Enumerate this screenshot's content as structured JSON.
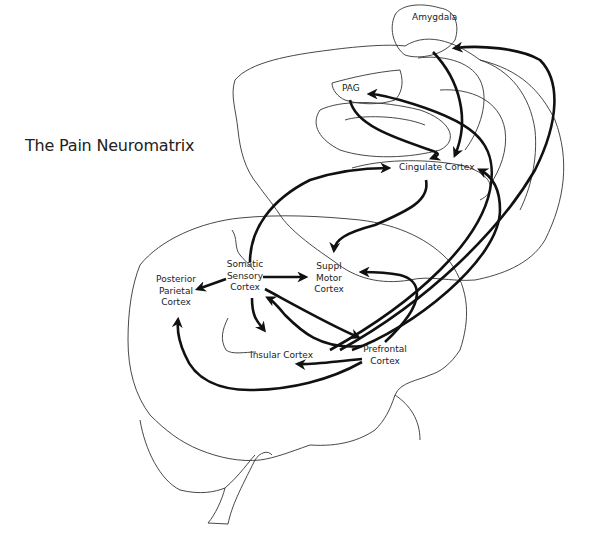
{
  "title": "The Pain Neuromatrix",
  "regions": {
    "amygdala": "Amygdala",
    "pag": "PAG",
    "cingulate": "Cingulate Cortex",
    "somatic_1": "Somatic",
    "somatic_2": "Sensory",
    "somatic_3": "Cortex",
    "suppl_1": "Suppl",
    "suppl_2": "Motor",
    "suppl_3": "Cortex",
    "posterior_1": "Posterior",
    "posterior_2": "Parietal",
    "posterior_3": "Cortex",
    "insular": "Insular Cortex",
    "prefrontal_1": "Prefrontal",
    "prefrontal_2": "Cortex"
  },
  "connections": [
    {
      "from": "Amygdala",
      "to": "Cingulate Cortex"
    },
    {
      "from": "Prefrontal Cortex",
      "to": "Amygdala"
    },
    {
      "from": "Prefrontal Cortex",
      "to": "PAG"
    },
    {
      "from": "PAG",
      "to": "Cingulate Cortex"
    },
    {
      "from": "Somatic Sensory Cortex",
      "to": "Cingulate Cortex"
    },
    {
      "from": "Prefrontal Cortex",
      "to": "Cingulate Cortex"
    },
    {
      "from": "Cingulate Cortex",
      "to": "Suppl Motor Cortex"
    },
    {
      "from": "Somatic Sensory Cortex",
      "to": "Suppl Motor Cortex"
    },
    {
      "from": "Prefrontal Cortex",
      "to": "Suppl Motor Cortex"
    },
    {
      "from": "Somatic Sensory Cortex",
      "to": "Posterior Parietal Cortex"
    },
    {
      "from": "Somatic Sensory Cortex",
      "to": "Insular Cortex"
    },
    {
      "from": "Somatic Sensory Cortex",
      "to": "Prefrontal Cortex"
    },
    {
      "from": "Prefrontal Cortex",
      "to": "Somatic Sensory Cortex"
    },
    {
      "from": "Prefrontal Cortex",
      "to": "Insular Cortex"
    },
    {
      "from": "Prefrontal Cortex",
      "to": "Posterior Parietal Cortex"
    }
  ]
}
